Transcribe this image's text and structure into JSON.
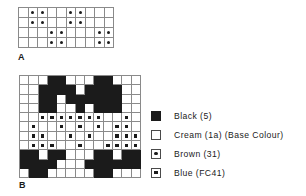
{
  "charts": [
    {
      "id": "A",
      "label": "A",
      "cols": 10,
      "rows": 4,
      "cells": [
        [
          "cream",
          "brown",
          "brown",
          "cream",
          "cream",
          "brown",
          "brown",
          "cream",
          "cream",
          "cream"
        ],
        [
          "cream",
          "brown",
          "brown",
          "cream",
          "cream",
          "brown",
          "brown",
          "cream",
          "cream",
          "cream"
        ],
        [
          "cream",
          "cream",
          "cream",
          "brown",
          "brown",
          "cream",
          "cream",
          "cream",
          "brown",
          "brown"
        ],
        [
          "cream",
          "cream",
          "cream",
          "brown",
          "brown",
          "cream",
          "cream",
          "cream",
          "brown",
          "brown"
        ]
      ]
    },
    {
      "id": "B",
      "label": "B",
      "cols": 13,
      "rows": 11,
      "cells": [
        [
          "cream",
          "cream",
          "cream",
          "black",
          "black",
          "cream",
          "cream",
          "cream",
          "black",
          "black",
          "cream",
          "cream",
          "cream"
        ],
        [
          "cream",
          "cream",
          "black",
          "black",
          "black",
          "black",
          "cream",
          "black",
          "black",
          "black",
          "black",
          "cream",
          "cream"
        ],
        [
          "cream",
          "cream",
          "black",
          "black",
          "cream",
          "black",
          "black",
          "black",
          "black",
          "black",
          "black",
          "cream",
          "cream"
        ],
        [
          "cream",
          "cream",
          "black",
          "black",
          "cream",
          "cream",
          "black",
          "cream",
          "black",
          "black",
          "black",
          "cream",
          "cream"
        ],
        [
          "cream",
          "cream",
          "blue",
          "blue",
          "blue",
          "blue",
          "blue",
          "blue",
          "blue",
          "cream",
          "cream",
          "blue",
          "cream"
        ],
        [
          "cream",
          "blue",
          "cream",
          "cream",
          "blue",
          "cream",
          "blue",
          "cream",
          "blue",
          "cream",
          "blue",
          "blue",
          "cream"
        ],
        [
          "cream",
          "blue",
          "blue",
          "cream",
          "cream",
          "blue",
          "cream",
          "blue",
          "cream",
          "cream",
          "blue",
          "blue",
          "blue"
        ],
        [
          "cream",
          "blue",
          "blue",
          "blue",
          "cream",
          "cream",
          "blue",
          "cream",
          "cream",
          "blue",
          "blue",
          "blue",
          "blue"
        ],
        [
          "black",
          "black",
          "cream",
          "black",
          "black",
          "cream",
          "cream",
          "cream",
          "black",
          "black",
          "cream",
          "black",
          "black"
        ],
        [
          "black",
          "black",
          "black",
          "black",
          "cream",
          "cream",
          "cream",
          "black",
          "black",
          "black",
          "black",
          "black",
          "black"
        ],
        [
          "cream",
          "black",
          "black",
          "cream",
          "cream",
          "cream",
          "cream",
          "cream",
          "black",
          "black",
          "cream",
          "cream",
          "cream"
        ]
      ]
    }
  ],
  "legend": {
    "items": [
      {
        "swatch": "black",
        "label": "Black (5)"
      },
      {
        "swatch": "cream",
        "label": "Cream (1a) (Base Colour)"
      },
      {
        "swatch": "brown",
        "label": "Brown (31)"
      },
      {
        "swatch": "blue",
        "label": "Blue (FC41)"
      }
    ]
  },
  "colors": {
    "ink": "#1b1b1b",
    "grid_line": "#8a8a8a",
    "base": "#ffffff"
  }
}
